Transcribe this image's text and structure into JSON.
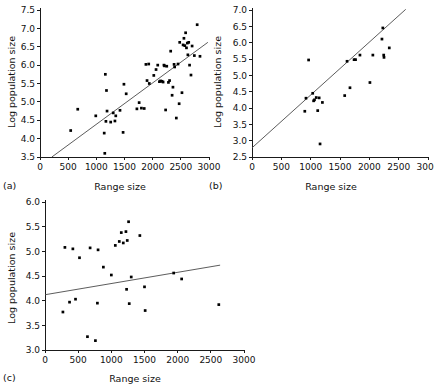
{
  "figure": {
    "background": "#ffffff",
    "point_color": "#000000",
    "line_color": "#4a4a4a",
    "axis_color": "#1a1a1a"
  },
  "chart_data": [
    {
      "type": "scatter",
      "panel": "(a)",
      "title": "",
      "xlabel": "Range size",
      "ylabel": "Log population size",
      "xlim": [
        0,
        3000
      ],
      "ylim": [
        3.5,
        7.5
      ],
      "xticks": [
        0,
        500,
        1000,
        1500,
        2000,
        2500,
        3000
      ],
      "xticklabels": [
        "0",
        "500",
        "1000",
        "1500",
        "2000",
        "2500",
        "3000"
      ],
      "yticks": [
        3.5,
        4.0,
        4.5,
        5.0,
        5.5,
        6.0,
        6.5,
        7.0,
        7.5
      ],
      "yticklabels": [
        "3.5",
        "4.0",
        "4.5",
        "5.0",
        "5.5",
        "6.0",
        "6.5",
        "7.0",
        "7.5"
      ],
      "grid": false,
      "legend": "none",
      "fit_line": {
        "x0": 210,
        "y0": 3.5,
        "x1": 2980,
        "y1": 6.62
      },
      "points": [
        [
          545,
          4.22
        ],
        [
          670,
          4.8
        ],
        [
          990,
          4.62
        ],
        [
          1140,
          4.15
        ],
        [
          1150,
          3.6
        ],
        [
          1160,
          5.75
        ],
        [
          1170,
          4.47
        ],
        [
          1180,
          5.31
        ],
        [
          1190,
          4.75
        ],
        [
          1255,
          4.45
        ],
        [
          1300,
          4.7
        ],
        [
          1330,
          4.48
        ],
        [
          1345,
          4.62
        ],
        [
          1420,
          4.77
        ],
        [
          1475,
          4.17
        ],
        [
          1490,
          5.48
        ],
        [
          1530,
          5.22
        ],
        [
          1720,
          4.81
        ],
        [
          1760,
          4.98
        ],
        [
          1800,
          4.83
        ],
        [
          1850,
          4.82
        ],
        [
          1880,
          6.02
        ],
        [
          1900,
          5.58
        ],
        [
          1930,
          6.03
        ],
        [
          1940,
          5.5
        ],
        [
          2020,
          5.72
        ],
        [
          2060,
          5.88
        ],
        [
          2090,
          6.0
        ],
        [
          2120,
          5.55
        ],
        [
          2140,
          5.57
        ],
        [
          2165,
          5.56
        ],
        [
          2185,
          5.54
        ],
        [
          2200,
          6.0
        ],
        [
          2210,
          5.98
        ],
        [
          2230,
          4.78
        ],
        [
          2250,
          5.97
        ],
        [
          2280,
          5.53
        ],
        [
          2300,
          5.58
        ],
        [
          2320,
          6.38
        ],
        [
          2345,
          5.18
        ],
        [
          2360,
          5.4
        ],
        [
          2380,
          6.02
        ],
        [
          2390,
          5.95
        ],
        [
          2420,
          4.56
        ],
        [
          2450,
          6.03
        ],
        [
          2470,
          4.95
        ],
        [
          2480,
          6.62
        ],
        [
          2520,
          5.25
        ],
        [
          2540,
          6.55
        ],
        [
          2555,
          6.73
        ],
        [
          2570,
          6.53
        ],
        [
          2585,
          6.88
        ],
        [
          2600,
          6.47
        ],
        [
          2615,
          6.6
        ],
        [
          2625,
          6.28
        ],
        [
          2640,
          6.62
        ],
        [
          2655,
          6.0
        ],
        [
          2680,
          5.73
        ],
        [
          2700,
          6.52
        ],
        [
          2740,
          6.26
        ],
        [
          2790,
          7.1
        ],
        [
          2840,
          6.24
        ]
      ]
    },
    {
      "type": "scatter",
      "panel": "(b)",
      "title": "",
      "xlabel": "Range size",
      "ylabel": "Log population size",
      "xlim": [
        0,
        3000
      ],
      "ylim": [
        2.5,
        7.0
      ],
      "xticks": [
        0,
        500,
        1000,
        1500,
        2000,
        2500,
        3000
      ],
      "xticklabels": [
        "0",
        "500",
        "1000",
        "1500",
        "2000",
        "2500",
        "3000"
      ],
      "yticks": [
        2.5,
        3.0,
        3.5,
        4.0,
        4.5,
        5.0,
        5.5,
        6.0,
        6.5,
        7.0
      ],
      "yticklabels": [
        "2.5",
        "3.0",
        "3.5",
        "4.0",
        "4.5",
        "5.0",
        "5.5",
        "6.0",
        "6.5",
        "7.0"
      ],
      "grid": false,
      "legend": "none",
      "fit_line": {
        "x0": 0,
        "y0": 2.78,
        "x1": 2620,
        "y1": 7.02
      },
      "points": [
        [
          900,
          3.9
        ],
        [
          920,
          4.3
        ],
        [
          965,
          5.47
        ],
        [
          1035,
          4.45
        ],
        [
          1050,
          4.22
        ],
        [
          1065,
          4.25
        ],
        [
          1095,
          4.32
        ],
        [
          1120,
          3.92
        ],
        [
          1145,
          4.31
        ],
        [
          1160,
          2.9
        ],
        [
          1200,
          4.17
        ],
        [
          1580,
          4.38
        ],
        [
          1620,
          5.43
        ],
        [
          1670,
          4.62
        ],
        [
          1740,
          5.48
        ],
        [
          1765,
          5.48
        ],
        [
          1840,
          5.62
        ],
        [
          2010,
          4.78
        ],
        [
          2060,
          5.62
        ],
        [
          2215,
          6.11
        ],
        [
          2230,
          6.45
        ],
        [
          2245,
          5.62
        ],
        [
          2250,
          5.55
        ],
        [
          2340,
          5.84
        ]
      ]
    },
    {
      "type": "scatter",
      "panel": "(c)",
      "title": "",
      "xlabel": "Range size",
      "ylabel": "Log population size",
      "xlim": [
        0,
        3000
      ],
      "ylim": [
        3.0,
        6.0
      ],
      "xticks": [
        0,
        500,
        1000,
        1500,
        2000,
        2500,
        3000
      ],
      "xticklabels": [
        "0",
        "500",
        "1000",
        "1500",
        "2000",
        "2500",
        "3000"
      ],
      "yticks": [
        3.0,
        3.5,
        4.0,
        4.5,
        5.0,
        5.5,
        6.0
      ],
      "yticklabels": [
        "3.0",
        "3.5",
        "4.0",
        "4.5",
        "5.0",
        "5.5",
        "6.0"
      ],
      "grid": false,
      "legend": "none",
      "fit_line": {
        "x0": 0,
        "y0": 4.12,
        "x1": 2640,
        "y1": 4.72
      },
      "points": [
        [
          270,
          3.77
        ],
        [
          300,
          5.08
        ],
        [
          370,
          3.97
        ],
        [
          420,
          5.05
        ],
        [
          460,
          4.03
        ],
        [
          520,
          4.87
        ],
        [
          640,
          3.27
        ],
        [
          680,
          5.07
        ],
        [
          760,
          3.19
        ],
        [
          790,
          3.95
        ],
        [
          800,
          5.03
        ],
        [
          880,
          4.68
        ],
        [
          1000,
          4.52
        ],
        [
          1060,
          5.12
        ],
        [
          1120,
          5.2
        ],
        [
          1150,
          5.38
        ],
        [
          1180,
          5.17
        ],
        [
          1220,
          5.4
        ],
        [
          1230,
          4.23
        ],
        [
          1240,
          5.22
        ],
        [
          1260,
          5.6
        ],
        [
          1270,
          3.94
        ],
        [
          1300,
          4.48
        ],
        [
          1430,
          5.32
        ],
        [
          1500,
          4.28
        ],
        [
          1510,
          3.8
        ],
        [
          1940,
          4.56
        ],
        [
          2060,
          4.44
        ],
        [
          2620,
          3.92
        ]
      ]
    }
  ]
}
